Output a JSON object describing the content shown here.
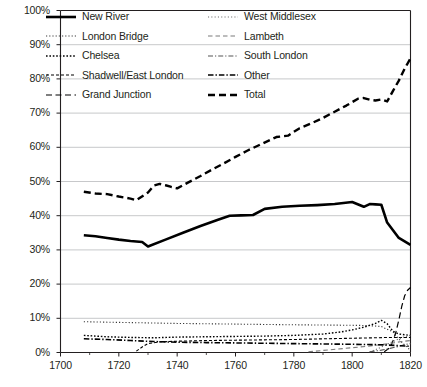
{
  "chart_data": {
    "type": "line",
    "title": "",
    "subtitle": "",
    "xlabel": "",
    "ylabel": "",
    "xlim": [
      1700,
      1820
    ],
    "ylim": [
      0,
      1
    ],
    "grid": true,
    "legend_position": "top-inside",
    "xticks": [
      "1700",
      "1720",
      "1740",
      "1760",
      "1780",
      "1800",
      "1820"
    ],
    "xtick_values": [
      1700,
      1720,
      1740,
      1760,
      1780,
      1800,
      1820
    ],
    "yticks": [
      "0%",
      "10%",
      "20%",
      "30%",
      "40%",
      "50%",
      "60%",
      "70%",
      "80%",
      "90%",
      "100%"
    ],
    "ytick_values": [
      0,
      10,
      20,
      30,
      40,
      50,
      60,
      70,
      80,
      90,
      100
    ],
    "series": [
      {
        "name": "New River",
        "style": "solid",
        "width": 2.6,
        "color": "#000000",
        "points": [
          [
            1708,
            34.3
          ],
          [
            1712,
            34.0
          ],
          [
            1716,
            33.5
          ],
          [
            1720,
            33.0
          ],
          [
            1724,
            32.6
          ],
          [
            1728,
            32.3
          ],
          [
            1730,
            31.0
          ],
          [
            1736,
            33.0
          ],
          [
            1742,
            35.0
          ],
          [
            1748,
            37.0
          ],
          [
            1754,
            38.8
          ],
          [
            1758,
            40.0
          ],
          [
            1762,
            40.1
          ],
          [
            1766,
            40.2
          ],
          [
            1770,
            42.0
          ],
          [
            1776,
            42.6
          ],
          [
            1782,
            42.9
          ],
          [
            1788,
            43.1
          ],
          [
            1794,
            43.4
          ],
          [
            1800,
            44.0
          ],
          [
            1804,
            42.6
          ],
          [
            1806,
            43.4
          ],
          [
            1808,
            43.3
          ],
          [
            1810,
            43.2
          ],
          [
            1812,
            38.0
          ],
          [
            1816,
            33.5
          ],
          [
            1820,
            31.5
          ]
        ]
      },
      {
        "name": "London Bridge",
        "style": "dotted-fine",
        "width": 1.1,
        "color": "#3a3a3a",
        "points": [
          [
            1708,
            9.0
          ],
          [
            1720,
            8.8
          ],
          [
            1740,
            8.5
          ],
          [
            1760,
            8.3
          ],
          [
            1780,
            8.1
          ],
          [
            1795,
            8.0
          ],
          [
            1805,
            7.9
          ],
          [
            1810,
            7.6
          ],
          [
            1814,
            6.0
          ],
          [
            1817,
            3.0
          ],
          [
            1820,
            0.6
          ]
        ]
      },
      {
        "name": "Chelsea",
        "style": "dotted-bold",
        "width": 1.4,
        "color": "#000000",
        "points": [
          [
            1708,
            5.0
          ],
          [
            1716,
            4.6
          ],
          [
            1724,
            4.4
          ],
          [
            1732,
            4.3
          ],
          [
            1740,
            4.5
          ],
          [
            1750,
            4.6
          ],
          [
            1760,
            4.7
          ],
          [
            1770,
            4.8
          ],
          [
            1780,
            5.0
          ],
          [
            1790,
            5.4
          ],
          [
            1796,
            6.0
          ],
          [
            1800,
            6.6
          ],
          [
            1804,
            7.4
          ],
          [
            1808,
            8.5
          ],
          [
            1810,
            9.4
          ],
          [
            1812,
            8.4
          ],
          [
            1814,
            6.2
          ],
          [
            1816,
            5.4
          ],
          [
            1818,
            5.2
          ],
          [
            1820,
            5.0
          ]
        ]
      },
      {
        "name": "Shadwell/East London",
        "style": "dashed-fine",
        "width": 1.1,
        "color": "#000000",
        "points": [
          [
            1726,
            0.4
          ],
          [
            1728,
            1.6
          ],
          [
            1730,
            2.6
          ],
          [
            1734,
            3.1
          ],
          [
            1740,
            3.3
          ],
          [
            1750,
            3.5
          ],
          [
            1760,
            3.6
          ],
          [
            1770,
            3.7
          ],
          [
            1780,
            3.8
          ],
          [
            1790,
            4.0
          ],
          [
            1796,
            4.1
          ],
          [
            1802,
            4.2
          ],
          [
            1808,
            4.3
          ],
          [
            1812,
            4.4
          ],
          [
            1816,
            4.4
          ],
          [
            1820,
            4.4
          ]
        ]
      },
      {
        "name": "Grand Junction",
        "style": "dashed-long",
        "width": 1.2,
        "color": "#000000",
        "points": [
          [
            1811,
            0.2
          ],
          [
            1813,
            1.4
          ],
          [
            1814,
            3.4
          ],
          [
            1815,
            6.0
          ],
          [
            1816,
            9.5
          ],
          [
            1817,
            13.5
          ],
          [
            1818,
            16.6
          ],
          [
            1819,
            18.2
          ],
          [
            1820,
            19.0
          ]
        ]
      },
      {
        "name": "West Middlesex",
        "style": "dotted-fine2",
        "width": 1.1,
        "color": "#6b6b6b",
        "points": [
          [
            1806,
            0.2
          ],
          [
            1808,
            0.8
          ],
          [
            1810,
            1.6
          ],
          [
            1812,
            2.4
          ],
          [
            1814,
            3.2
          ],
          [
            1816,
            4.0
          ],
          [
            1818,
            4.6
          ],
          [
            1820,
            5.0
          ]
        ]
      },
      {
        "name": "Lambeth",
        "style": "dashed-med",
        "width": 1.1,
        "color": "#7a7a7a",
        "points": [
          [
            1785,
            0.2
          ],
          [
            1790,
            0.6
          ],
          [
            1795,
            1.0
          ],
          [
            1800,
            1.4
          ],
          [
            1805,
            1.8
          ],
          [
            1810,
            2.3
          ],
          [
            1814,
            2.8
          ],
          [
            1817,
            3.2
          ],
          [
            1820,
            3.5
          ]
        ]
      },
      {
        "name": "South London",
        "style": "dash-dot",
        "width": 1.1,
        "color": "#555555",
        "points": [
          [
            1806,
            0.2
          ],
          [
            1810,
            0.7
          ],
          [
            1813,
            1.2
          ],
          [
            1816,
            1.8
          ],
          [
            1818,
            2.3
          ],
          [
            1820,
            2.6
          ]
        ]
      },
      {
        "name": "Other",
        "style": "dash-dot-bold",
        "width": 1.6,
        "color": "#000000",
        "points": [
          [
            1708,
            4.0
          ],
          [
            1716,
            3.8
          ],
          [
            1724,
            3.5
          ],
          [
            1732,
            3.2
          ],
          [
            1740,
            3.0
          ],
          [
            1750,
            2.9
          ],
          [
            1760,
            2.8
          ],
          [
            1770,
            2.7
          ],
          [
            1780,
            2.6
          ],
          [
            1790,
            2.5
          ],
          [
            1800,
            2.4
          ],
          [
            1808,
            2.3
          ],
          [
            1812,
            2.2
          ],
          [
            1816,
            2.0
          ],
          [
            1820,
            1.8
          ]
        ]
      },
      {
        "name": "Total",
        "style": "dashed-bold",
        "width": 2.4,
        "color": "#000000",
        "points": [
          [
            1708,
            47.0
          ],
          [
            1712,
            46.5
          ],
          [
            1716,
            46.3
          ],
          [
            1720,
            45.6
          ],
          [
            1724,
            45.0
          ],
          [
            1726,
            44.5
          ],
          [
            1730,
            46.8
          ],
          [
            1732,
            48.8
          ],
          [
            1734,
            49.3
          ],
          [
            1736,
            48.9
          ],
          [
            1738,
            48.4
          ],
          [
            1740,
            48.0
          ],
          [
            1744,
            49.8
          ],
          [
            1748,
            51.6
          ],
          [
            1752,
            53.5
          ],
          [
            1756,
            55.3
          ],
          [
            1760,
            57.2
          ],
          [
            1764,
            59.0
          ],
          [
            1768,
            60.6
          ],
          [
            1772,
            62.2
          ],
          [
            1774,
            63.0
          ],
          [
            1778,
            63.4
          ],
          [
            1782,
            65.6
          ],
          [
            1786,
            67.0
          ],
          [
            1790,
            68.6
          ],
          [
            1794,
            70.4
          ],
          [
            1798,
            72.2
          ],
          [
            1802,
            74.2
          ],
          [
            1804,
            74.4
          ],
          [
            1806,
            73.9
          ],
          [
            1808,
            73.7
          ],
          [
            1810,
            74.0
          ],
          [
            1812,
            73.4
          ],
          [
            1814,
            76.5
          ],
          [
            1816,
            79.5
          ],
          [
            1818,
            83.0
          ],
          [
            1820,
            86.0
          ]
        ]
      }
    ]
  },
  "legend": {
    "columns": [
      [
        {
          "label": "New River",
          "style": "solid",
          "swatch": "legend-solid"
        },
        {
          "label": "London Bridge",
          "style": "dotted-fine",
          "swatch": "legend-dotted-fine"
        },
        {
          "label": "Chelsea",
          "style": "dotted-bold",
          "swatch": "legend-dotted-bold"
        },
        {
          "label": "Shadwell/East London",
          "style": "dashed-fine",
          "swatch": "legend-dashed-fine"
        },
        {
          "label": "Grand Junction",
          "style": "dashed-long",
          "swatch": "legend-dashed-long"
        }
      ],
      [
        {
          "label": "West Middlesex",
          "style": "dotted-fine2",
          "swatch": "legend-dotted-fine2"
        },
        {
          "label": "Lambeth",
          "style": "dashed-med",
          "swatch": "legend-dashed-med"
        },
        {
          "label": "South London",
          "style": "dash-dot",
          "swatch": "legend-dash-dot"
        },
        {
          "label": "Other",
          "style": "dash-dot-bold",
          "swatch": "legend-dash-dot-bold"
        },
        {
          "label": "Total",
          "style": "dashed-bold",
          "swatch": "legend-dashed-bold"
        }
      ]
    ]
  },
  "colors": {
    "axis": "#231f20",
    "grid": "#b9babc",
    "ink": "#000000",
    "background": "#ffffff"
  }
}
